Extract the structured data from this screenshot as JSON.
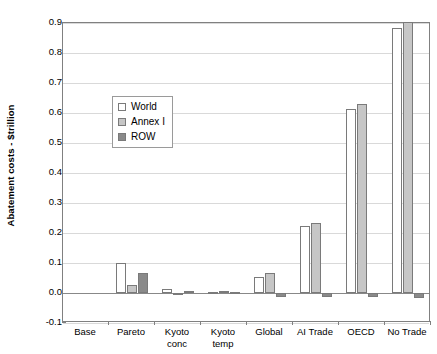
{
  "chart_data": {
    "type": "bar",
    "title": "",
    "xlabel": "",
    "ylabel": "Abatement costs - $trillion",
    "ylim": [
      -0.1,
      0.9
    ],
    "ytick_labels": [
      "0.9",
      "0.8",
      "0.7",
      "0.6",
      "0.5",
      "0.4",
      "0.3",
      "0.2",
      "0.1",
      "0.0",
      "-0.1"
    ],
    "ytick_values": [
      0.9,
      0.8,
      0.7,
      0.6,
      0.5,
      0.4,
      0.3,
      0.2,
      0.1,
      0.0,
      -0.1
    ],
    "grid": true,
    "legend_position": "inside-upper-left",
    "categories": [
      "Base",
      "Pareto",
      "Kyoto conc",
      "Kyoto temp",
      "Global",
      "AI Trade",
      "OECD",
      "No Trade"
    ],
    "category_lines": [
      [
        "Base"
      ],
      [
        "Pareto"
      ],
      [
        "Kyoto",
        "conc"
      ],
      [
        "Kyoto",
        "temp"
      ],
      [
        "Global"
      ],
      [
        "AI Trade"
      ],
      [
        "OECD"
      ],
      [
        "No Trade"
      ]
    ],
    "series": [
      {
        "name": "World",
        "color": "#ffffff",
        "values": [
          0.0,
          0.1,
          0.012,
          0.004,
          0.055,
          0.222,
          0.615,
          0.885
        ]
      },
      {
        "name": "Annex I",
        "color": "#c6c6c6",
        "values": [
          0.0,
          0.028,
          0.001,
          0.006,
          0.068,
          0.235,
          0.63,
          0.905
        ]
      },
      {
        "name": "ROW",
        "color": "#8a8a8a",
        "values": [
          0.0,
          0.068,
          0.008,
          0.005,
          -0.012,
          -0.013,
          -0.014,
          -0.017
        ]
      }
    ]
  },
  "legend": {
    "items": [
      {
        "label": "World"
      },
      {
        "label": "Annex I"
      },
      {
        "label": "ROW"
      }
    ]
  }
}
